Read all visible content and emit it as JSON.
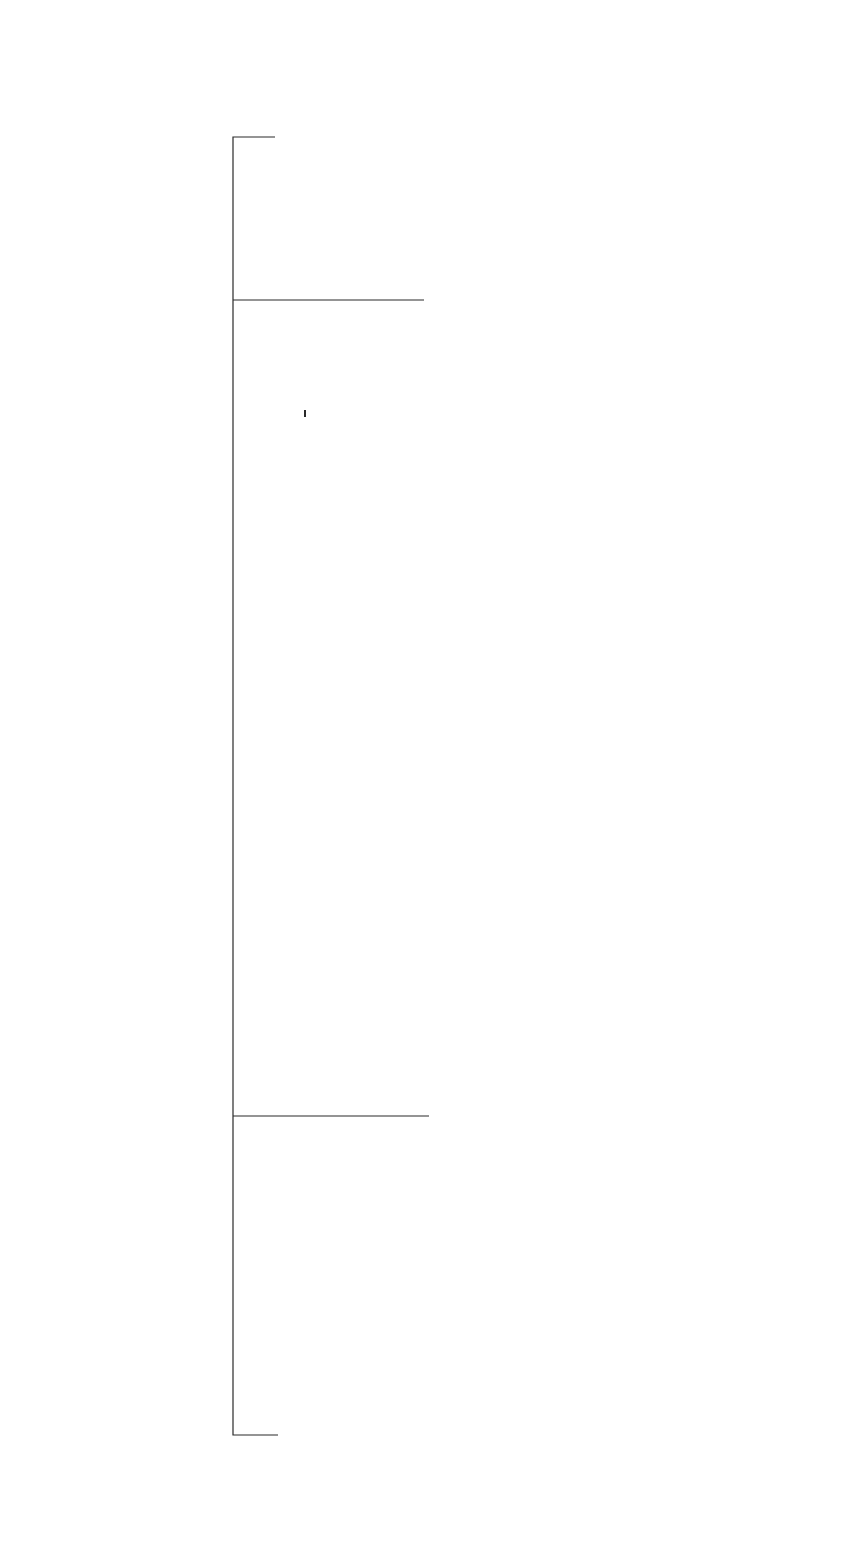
{
  "diagram": {
    "orientation": "rotated 90 degrees counter-clockwise",
    "nodes": {
      "bdd": {
        "stereotype": "«diagram»",
        "name": "Block Definition Diagram"
      },
      "instance_spec": {
        "stereotype": "«graphic node»",
        "name": "Instance Specification"
      },
      "relationship": {
        "stereotype": "«graphic path»",
        "name": "Relationship",
        "constraint": "{Abstract}"
      },
      "block": {
        "stereotype": "«graphic node»",
        "name": "Block"
      },
      "property": {
        "name": "Property",
        "constraint": "{Abstract}"
      },
      "flow_property": {
        "name": "Flow Property"
      },
      "interface_block": {
        "stereotype": "«graphic node»",
        "name": "Interface Block"
      },
      "port": {
        "stereotype": "«graphic node»",
        "name": "Port"
      },
      "full_port": {
        "stereotype": "«graphic node»",
        "name": "Full Port"
      },
      "proxy_port": {
        "stereotype": "«graphic node»",
        "name": "Proxy Port"
      },
      "item_flow": {
        "stereotype": "«graphic path»",
        "name": "Item Flow"
      }
    },
    "labels": {
      "relates_together": "relates together",
      "defines_instance_of": "defines instance of",
      "has_interaction_points": "has interaction points defined by",
      "is_typed_by_port_block": "is typed by",
      "is_typed_by_fullport_block": "is typed by",
      "is_typed_by_proxy_interface": "is typed by",
      "is_nested_with": "is nested with",
      "flows_between": "flows between",
      "conveys": "conveys",
      "incomplete": "{incomplete}"
    },
    "multiplicities": {
      "rel_left_star": "*",
      "rel_block_one": "1",
      "block_rel_12": "1..2",
      "block_left_1star": "1..*",
      "block_inst_1": "1",
      "inst_block_1star": "1..*",
      "bdd_inst_star": "*",
      "block_prop_star": "*",
      "block_port_has_1": "1",
      "block_port_typed_1": "1",
      "block_full_1": "1",
      "port_has_star": "*",
      "port_typed_star": "*",
      "port_left_star": "*",
      "port_nested_star": "*",
      "port_nested_1": "1",
      "port_flows_2": "2",
      "full_typed_star": "*",
      "iface_proxy_1": "1",
      "proxy_typed_star": "*",
      "flowprop_1": "1",
      "itemflow_left_star": "*",
      "itemflow_flows_star": "*",
      "itemflow_conveys_1": "1"
    },
    "caption": "Figure — Extended graphical model for Block Definition Diagram"
  }
}
